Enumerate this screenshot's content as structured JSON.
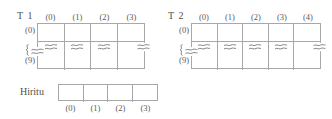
{
  "figure": {
    "tables": [
      {
        "name": "T 1",
        "column_headers": [
          "(0)",
          "(1)",
          "(2)",
          "(3)"
        ],
        "row_labels": [
          "(0)",
          "continuation-squiggle",
          "(9)"
        ],
        "row_labels_text": {
          "first": "(0)",
          "last": "(9)"
        },
        "columns": 4,
        "rows_shown": 3,
        "break_row_index": 1,
        "cells": [
          [
            "",
            "",
            "",
            ""
          ],
          [
            "break",
            "break",
            "break",
            "break"
          ],
          [
            "",
            "",
            "",
            ""
          ]
        ]
      },
      {
        "name": "T 2",
        "column_headers": [
          "(0)",
          "(1)",
          "(2)",
          "(3)",
          "(4)"
        ],
        "row_labels": [
          "(0)",
          "continuation-squiggle",
          "(9)"
        ],
        "row_labels_text": {
          "first": "(0)",
          "last": "(9)"
        },
        "columns": 5,
        "rows_shown": 3,
        "break_row_index": 1,
        "cells": [
          [
            "",
            "",
            "",
            "",
            ""
          ],
          [
            "break",
            "break",
            "break",
            "break",
            "break"
          ],
          [
            "",
            "",
            "",
            "",
            ""
          ]
        ]
      }
    ],
    "ratio_table": {
      "label": "Hiritu",
      "columns": 4,
      "column_footers": [
        "(0)",
        "(1)",
        "(2)",
        "(3)"
      ],
      "cells": [
        "",
        "",
        "",
        ""
      ]
    },
    "icons": {
      "break_mark": "axis-break-icon",
      "continuation": "vertical-ellipsis-squiggle-icon"
    },
    "colors": {
      "line": "#a8a8a8",
      "text": "#555555",
      "background": "#ffffff"
    }
  }
}
